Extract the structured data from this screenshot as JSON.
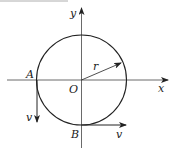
{
  "diagram": {
    "type": "circular-motion",
    "labels": {
      "y_axis": "y",
      "x_axis": "x",
      "origin": "O",
      "radius": "r",
      "point_a": "A",
      "point_b": "B",
      "velocity_a": "v",
      "velocity_b": "v"
    },
    "colors": {
      "stroke": "#222222",
      "background": "#ffffff"
    }
  }
}
